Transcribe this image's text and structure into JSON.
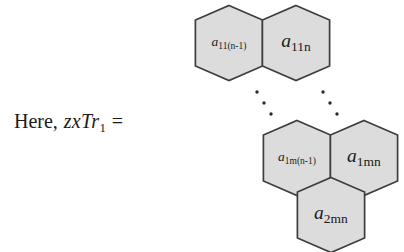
{
  "equation": {
    "lead_word": "Here,",
    "expr_main": "zxTr",
    "expr_sub": "1",
    "equals": "="
  },
  "diagram": {
    "type": "honeycomb-cell-array",
    "fill_color": "#dcdcdc",
    "stroke_color": "#3d3d3d",
    "background_color": "#ffffff",
    "text_color": "#1a1a1a",
    "cells": [
      {
        "id": "top-left",
        "base": "a",
        "sub": "11(n-1)",
        "sub_size": 9.5,
        "base_size": 13.5,
        "cx": 229,
        "cy": 43,
        "label_dx": 0
      },
      {
        "id": "top-right",
        "base": "a",
        "sub": "11n",
        "sub_size": 13.5,
        "base_size": 19.5,
        "cx": 296,
        "cy": 43,
        "label_dx": 0
      },
      {
        "id": "mid-left",
        "base": "a",
        "sub": "1m(n-1)",
        "sub_size": 9.5,
        "base_size": 13.5,
        "cx": 297,
        "cy": 158,
        "label_dx": 0
      },
      {
        "id": "mid-right",
        "base": "a",
        "sub": "1mn",
        "sub_size": 13.5,
        "base_size": 19.5,
        "cx": 364,
        "cy": 158,
        "label_dx": 0
      },
      {
        "id": "bottom",
        "base": "a",
        "sub": "2mn",
        "sub_size": 13.5,
        "base_size": 19.5,
        "cx": 331,
        "cy": 215,
        "label_dx": 0
      }
    ],
    "ellipses": [
      {
        "id": "ellipsis-left",
        "direction": "down-right",
        "dots": [
          {
            "x": 257,
            "y": 92
          },
          {
            "x": 264,
            "y": 103
          },
          {
            "x": 271,
            "y": 114
          }
        ]
      },
      {
        "id": "ellipsis-right",
        "direction": "down-right",
        "dots": [
          {
            "x": 323,
            "y": 92
          },
          {
            "x": 330,
            "y": 103
          },
          {
            "x": 337,
            "y": 114
          }
        ]
      }
    ]
  }
}
